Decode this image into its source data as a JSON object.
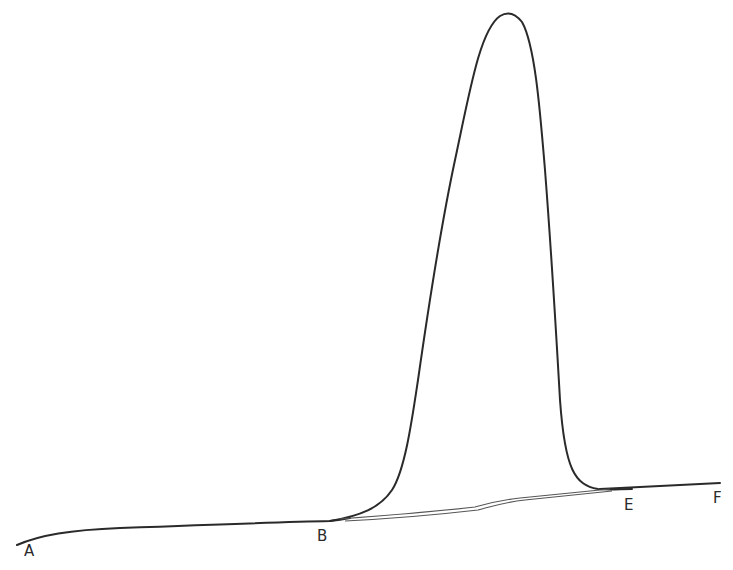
{
  "diagram": {
    "type": "peak-on-baseline",
    "stroke_color": "#2a2a2a",
    "points": [
      {
        "id": "A",
        "label": "A",
        "x": 31,
        "y": 550
      },
      {
        "id": "B",
        "label": "B",
        "x": 323,
        "y": 536
      },
      {
        "id": "E",
        "label": "E",
        "x": 628,
        "y": 504
      },
      {
        "id": "F",
        "label": "F",
        "x": 718,
        "y": 498
      }
    ],
    "peak_apex": {
      "x": 506,
      "y": 14
    }
  }
}
